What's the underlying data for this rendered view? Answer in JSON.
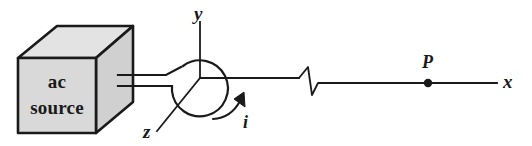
{
  "figure": {
    "kind": "physics-diagram",
    "colors": {
      "stroke": "#1a1a1a",
      "box_front_fill": "#d8d8d8",
      "box_top_fill": "#e2e2e2",
      "box_side_fill": "#cfcfcf",
      "background": "#ffffff",
      "text": "#1a1a1a"
    },
    "source_box": {
      "line1": "ac",
      "line2": "source"
    },
    "axes": [
      {
        "id": "y",
        "label": "y",
        "direction": "up"
      },
      {
        "id": "x",
        "label": "x",
        "direction": "right"
      },
      {
        "id": "z",
        "label": "z",
        "direction": "down-left"
      }
    ],
    "current": {
      "label": "i",
      "sense": "counterclockwise-arrow-on-loop"
    },
    "field_point": {
      "label": "P",
      "marker": "filled-dot-on-x-axis"
    },
    "break_symbol": {
      "name": "axis-break-zigzag",
      "meaning": "distance not to scale"
    },
    "icon_names": {
      "source_box": "ac-source-box-icon",
      "transmission_line": "twin-lead-wire-icon",
      "loop": "current-loop-icon",
      "current_arrow": "current-direction-arrow-icon",
      "break": "axis-break-icon",
      "point_marker": "point-p-marker-icon"
    }
  }
}
